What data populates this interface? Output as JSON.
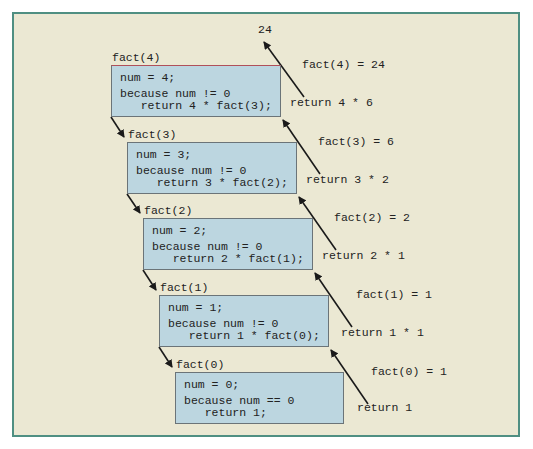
{
  "result_label": "24",
  "frames": [
    {
      "title": "fact(4)",
      "line1": "num = 4;",
      "line2": "because num != 0",
      "line3": "   return 4 * fact(3);",
      "returns_label": "fact(4) = 24",
      "return_expr": "return 4 * 6"
    },
    {
      "title": "fact(3)",
      "line1": "num = 3;",
      "line2": "because num != 0",
      "line3": "   return 3 * fact(2);",
      "returns_label": "fact(3) = 6",
      "return_expr": "return 3 * 2"
    },
    {
      "title": "fact(2)",
      "line1": "num = 2;",
      "line2": "because num != 0",
      "line3": "   return 2 * fact(1);",
      "returns_label": "fact(2) = 2",
      "return_expr": "return 2 * 1"
    },
    {
      "title": "fact(1)",
      "line1": "num = 1;",
      "line2": "because num != 0",
      "line3": "   return 1 * fact(0);",
      "returns_label": "fact(1) = 1",
      "return_expr": "return 1 * 1"
    },
    {
      "title": "fact(0)",
      "line1": "num = 0;",
      "line2": "because num == 0",
      "line3": "   return 1;",
      "returns_label": "fact(0) = 1",
      "return_expr": "return 1"
    }
  ],
  "colors": {
    "background": "#ebe8d3",
    "frame_border": "#4f8f82",
    "box_fill": "#bcd6e0",
    "box_border": "#6b7478",
    "arrow": "#1a1a1a"
  }
}
